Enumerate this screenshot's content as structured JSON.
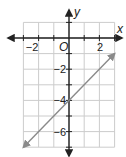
{
  "chart_data": {
    "type": "line",
    "title": "",
    "xlabel": "x",
    "ylabel": "y",
    "origin_label": "O",
    "xlim": [
      -3,
      3
    ],
    "ylim": [
      -7,
      1
    ],
    "grid": true,
    "x_ticks": [
      -2,
      2
    ],
    "y_ticks": [
      -2,
      -4,
      -6
    ],
    "x_tick_labels": [
      "−2",
      "2"
    ],
    "y_tick_labels": [
      "−2",
      "−4",
      "−6"
    ],
    "series": [
      {
        "name": "line",
        "equation": "y = x - 4",
        "slope": 1,
        "y_intercept": -4,
        "x": [
          -3,
          3
        ],
        "y": [
          -7,
          -1
        ],
        "arrows_both_ends": true,
        "color": "#8a8a8a"
      }
    ]
  },
  "colors": {
    "axis": "#222222",
    "grid": "#cccccc",
    "line": "#8a8a8a"
  }
}
